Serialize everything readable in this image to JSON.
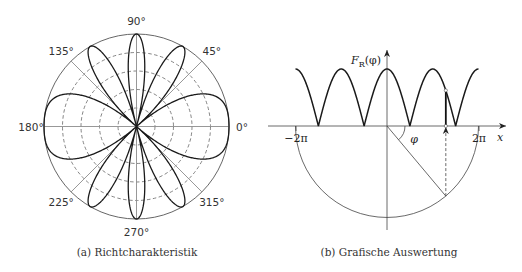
{
  "panels": {
    "a": {
      "caption": "(a) Richtcharakteristik",
      "angle_labels": [
        {
          "text": "0°",
          "deg": 0
        },
        {
          "text": "45°",
          "deg": 45
        },
        {
          "text": "90°",
          "deg": 90
        },
        {
          "text": "135°",
          "deg": 135
        },
        {
          "text": "180°",
          "deg": 180
        },
        {
          "text": "225°",
          "deg": 225
        },
        {
          "text": "270°",
          "deg": 270
        },
        {
          "text": "315°",
          "deg": 315
        }
      ]
    },
    "b": {
      "caption": "(b) Grafische Auswertung",
      "y_label_main": "F",
      "y_label_sub": "R",
      "y_label_arg": "(φ)",
      "x_label": "x",
      "tick_labels": [
        "−2π",
        "2π"
      ],
      "angle_label": "φ"
    }
  },
  "colors": {
    "curve": "#1a1a1a",
    "grid": "#8c8c8c",
    "axis": "#555555"
  },
  "chart_data": [
    {
      "type": "polar",
      "title": "(a) Richtcharakteristik",
      "function": "F(φ) = |cos(2π·cos φ)|",
      "theta_ticks_deg": [
        0,
        45,
        90,
        135,
        180,
        225,
        270,
        315
      ],
      "r_grid": [
        0.2,
        0.4,
        0.6,
        0.8,
        1.0
      ],
      "r_grid_style": "dashed inner circles, solid outer circle",
      "lobes_deg": [
        0,
        60,
        90,
        120,
        180,
        240,
        270,
        300
      ],
      "nulls_deg": [
        41.4,
        75.5,
        104.5,
        138.6,
        221.4,
        255.5,
        284.5,
        318.6
      ],
      "r_max": 1.0
    },
    {
      "type": "line",
      "title": "(b) Grafische Auswertung",
      "function": "F_R = |cos x|, x = 2π·cos φ",
      "xlabel": "x",
      "ylabel": "F_R(φ)",
      "xlim": [
        -6.283,
        6.283
      ],
      "x_ticks": [
        "−2π",
        "2π"
      ],
      "peaks_x": [
        "−2π",
        "−π",
        "0",
        "π",
        "2π"
      ],
      "zeros_x": [
        "−3π/2",
        "−π/2",
        "π/2",
        "3π/2"
      ],
      "construction": {
        "semicircle_radius": "2π",
        "example_phi_deg": 50,
        "projected_x": "2π·cos φ"
      }
    }
  ]
}
